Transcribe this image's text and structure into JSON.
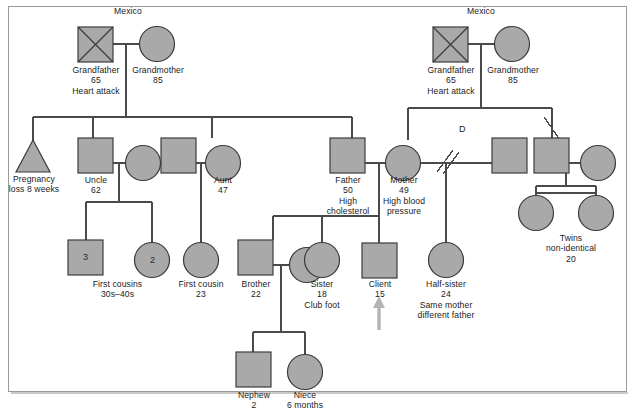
{
  "diagram": {
    "type": "genogram",
    "colors": {
      "shape_fill": "#a9a9a9",
      "shape_stroke": "#3c3c3c",
      "line": "#4a4a4a",
      "frame": "#9a9a9a",
      "arrow": "#b4b4b4",
      "text": "#1b1b1b"
    }
  },
  "annotations": {
    "country_left": "Mexico",
    "country_right": "Mexico",
    "divorce_marker": "D"
  },
  "people": {
    "paternal_grandfather": {
      "label": "Grandfather\n65\nHeart attack",
      "shape": "square",
      "deceased": true
    },
    "paternal_grandmother": {
      "label": "Grandmother\n85",
      "shape": "circle",
      "deceased": false
    },
    "maternal_grandfather": {
      "label": "Grandfather\n65\nHeart attack",
      "shape": "square",
      "deceased": true
    },
    "maternal_grandmother": {
      "label": "Grandmother\n85",
      "shape": "circle",
      "deceased": false
    },
    "pregnancy_loss": {
      "label": "Pregnancy\nloss 8 weeks",
      "shape": "triangle",
      "deceased": false
    },
    "uncle": {
      "label": "Uncle\n62",
      "shape": "square",
      "deceased": false
    },
    "uncle_partner": {
      "label": "",
      "shape": "circle",
      "deceased": false
    },
    "aunt_partner": {
      "label": "",
      "shape": "square",
      "deceased": false
    },
    "aunt": {
      "label": "Aunt\n47",
      "shape": "circle",
      "deceased": false
    },
    "father": {
      "label": "Father\n50\nHigh\ncholesterol",
      "shape": "square",
      "deceased": false
    },
    "mother": {
      "label": "Mother\n49\nHigh blood\npressure",
      "shape": "circle",
      "deceased": false
    },
    "mother_expartner": {
      "label": "",
      "shape": "square",
      "deceased": false
    },
    "uncle_right": {
      "label": "",
      "shape": "square",
      "deceased": false
    },
    "uncle_right_partner": {
      "label": "",
      "shape": "circle",
      "deceased": false
    },
    "first_cousins_group_male": {
      "label": "First cousins\n30s–40s",
      "shape": "square",
      "count": "3"
    },
    "first_cousins_group_female": {
      "label": "",
      "shape": "circle",
      "count": "2"
    },
    "first_cousin": {
      "label": "First cousin\n23",
      "shape": "circle"
    },
    "brother": {
      "label": "Brother\n22",
      "shape": "square"
    },
    "brother_partner": {
      "label": "",
      "shape": "circle"
    },
    "sister": {
      "label": "Sister\n18\nClub foot",
      "shape": "circle"
    },
    "client": {
      "label": "Client\n15",
      "shape": "square"
    },
    "half_sister": {
      "label": "Half-sister\n24\nSame mother\ndifferent father",
      "shape": "circle"
    },
    "twin_one": {
      "label": "",
      "shape": "circle"
    },
    "twin_two": {
      "label": "Twins\nnon-identical\n20",
      "shape": "circle"
    },
    "nephew": {
      "label": "Nephew\n2",
      "shape": "square"
    },
    "niece": {
      "label": "Niece\n6 months",
      "shape": "circle"
    }
  }
}
